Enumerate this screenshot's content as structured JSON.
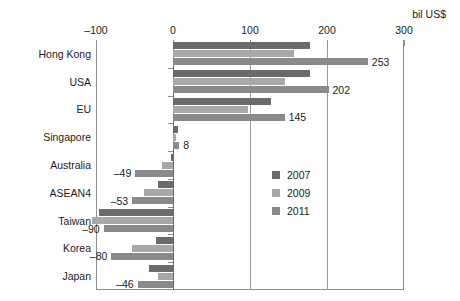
{
  "units_label": "bil US$",
  "axis": {
    "ticks": [
      -100,
      0,
      100,
      200,
      300
    ],
    "tick_labels": [
      "–100",
      "0",
      "100",
      "200",
      "300"
    ],
    "xmin": -100,
    "xmax": 300
  },
  "legend": {
    "position": "inside-right",
    "entries": [
      {
        "label": "2007",
        "color": "#6b6b6b"
      },
      {
        "label": "2009",
        "color": "#a8a8a8"
      },
      {
        "label": "2011",
        "color": "#8a8a8a"
      }
    ]
  },
  "chart_data": {
    "type": "bar",
    "orientation": "horizontal",
    "title": "",
    "xlabel": "bil US$",
    "ylabel": "",
    "xlim": [
      -100,
      300
    ],
    "grid": true,
    "categories": [
      "Hong Kong",
      "USA",
      "EU",
      "Singapore",
      "Australia",
      "ASEAN4",
      "Taiwan",
      "Korea",
      "Japan"
    ],
    "series": [
      {
        "name": "2007",
        "color": "#6b6b6b",
        "values": [
          178,
          178,
          127,
          6,
          -3,
          -20,
          -96,
          -22,
          -31
        ]
      },
      {
        "name": "2009",
        "color": "#a8a8a8",
        "values": [
          157,
          145,
          98,
          4,
          -14,
          -38,
          -105,
          -53,
          -20
        ]
      },
      {
        "name": "2011",
        "color": "#8a8a8a",
        "values": [
          253,
          202,
          145,
          8,
          -49,
          -53,
          -90,
          -80,
          -46
        ]
      }
    ],
    "data_labels": [
      {
        "category": "Hong Kong",
        "series": "2011",
        "text": "253",
        "value": 253
      },
      {
        "category": "USA",
        "series": "2011",
        "text": "202",
        "value": 202
      },
      {
        "category": "EU",
        "series": "2011",
        "text": "145",
        "value": 145
      },
      {
        "category": "Singapore",
        "series": "2011",
        "text": "8",
        "value": 8
      },
      {
        "category": "Australia",
        "series": "2011",
        "text": "–49",
        "value": -49
      },
      {
        "category": "ASEAN4",
        "series": "2011",
        "text": "–53",
        "value": -53
      },
      {
        "category": "Taiwan",
        "series": "2011",
        "text": "–90",
        "value": -90
      },
      {
        "category": "Korea",
        "series": "2011",
        "text": "–80",
        "value": -80
      },
      {
        "category": "Japan",
        "series": "2011",
        "text": "–46",
        "value": -46
      }
    ]
  }
}
